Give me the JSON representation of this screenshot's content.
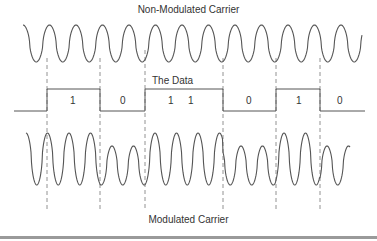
{
  "diagram": {
    "title_top": "Non-Modulated Carrier",
    "title_data": "The Data",
    "title_bottom": "Modulated Carrier",
    "bits": [
      "1",
      "0",
      "1",
      "1",
      "0",
      "1",
      "0"
    ],
    "bit_boundaries_x": [
      47,
      100,
      145,
      223,
      276,
      320
    ],
    "colors": {
      "line": "#555555",
      "dash": "#777777",
      "text": "#333333",
      "footer_bar": "#9a9a9a"
    }
  }
}
